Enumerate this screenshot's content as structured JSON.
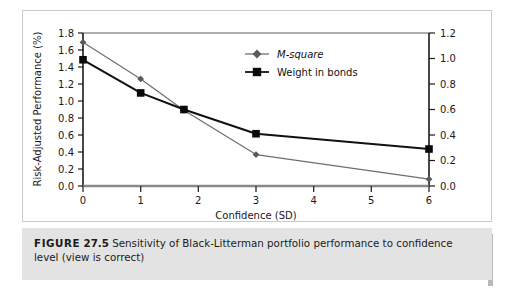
{
  "figure": {
    "caption_label": "FIGURE",
    "caption_number": "27.5",
    "caption_text": "Sensitivity of Black-Litterman portfolio performance to confidence level (view is correct)"
  },
  "chart_data": {
    "type": "line",
    "title": "",
    "xlabel": "Confidence (SD)",
    "ylabel": "Risk-Adjusted Performance (%)",
    "y2label": "",
    "x": [
      0,
      1,
      1.75,
      3,
      6
    ],
    "xlim": [
      0,
      6
    ],
    "ylim": [
      0.0,
      1.8
    ],
    "y2lim": [
      0.0,
      1.2
    ],
    "xticks": [
      "0",
      "1",
      "2",
      "3",
      "4",
      "5",
      "6"
    ],
    "xtick_values": [
      0,
      1,
      2,
      3,
      4,
      5,
      6
    ],
    "yticks": [
      "0.0",
      "0.2",
      "0.4",
      "0.6",
      "0.8",
      "1.0",
      "1.2",
      "1.4",
      "1.6",
      "1.8"
    ],
    "ytick_values": [
      0.0,
      0.2,
      0.4,
      0.6,
      0.8,
      1.0,
      1.2,
      1.4,
      1.6,
      1.8
    ],
    "y2ticks": [
      "0.0",
      "0.2",
      "0.4",
      "0.6",
      "0.8",
      "1.0",
      "1.2"
    ],
    "y2tick_values": [
      0.0,
      0.2,
      0.4,
      0.6,
      0.8,
      1.0,
      1.2
    ],
    "grid": false,
    "legend_position": "upper-center",
    "series": [
      {
        "name": "M-square",
        "axis": "left",
        "marker": "diamond",
        "color": "#6e6e6e",
        "marker_color": "#5a5a5a",
        "values": [
          1.69,
          1.26,
          0.89,
          0.37,
          0.08
        ]
      },
      {
        "name": "Weight in bonds",
        "axis": "right",
        "marker": "square",
        "color": "#111111",
        "marker_color": "#0a0a0a",
        "values": [
          0.99,
          0.73,
          0.6,
          0.41,
          0.29
        ]
      }
    ],
    "legend": [
      "M-square",
      "Weight in bonds"
    ]
  },
  "colors": {
    "panel_background": "#ffffff",
    "panel_border": "#c9c9c9",
    "caption_background": "#e3e3e3",
    "axis": "#1a1a1a",
    "series_msquare": "#6e6e6e",
    "series_bonds": "#111111"
  }
}
